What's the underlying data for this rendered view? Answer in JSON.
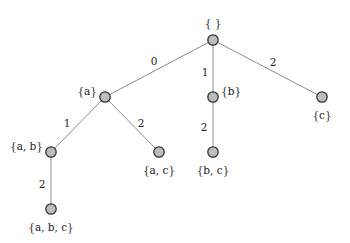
{
  "colors": {
    "node_fill": "#bdbdbd",
    "node_stroke": "#333333",
    "edge": "#8c8c8c",
    "text": "#222222"
  },
  "nodes": [
    {
      "id": "root",
      "label": "{ }",
      "x": 213,
      "y": 40,
      "lx": 213,
      "ly": 24,
      "anchor": "middle"
    },
    {
      "id": "a",
      "label": "{a}",
      "x": 105,
      "y": 97,
      "lx": 97,
      "ly": 92,
      "anchor": "end"
    },
    {
      "id": "b",
      "label": "{b}",
      "x": 213,
      "y": 97,
      "lx": 221,
      "ly": 92,
      "anchor": "start"
    },
    {
      "id": "c",
      "label": "{c}",
      "x": 322,
      "y": 97,
      "lx": 322,
      "ly": 116,
      "anchor": "middle"
    },
    {
      "id": "ab",
      "label": "{a, b}",
      "x": 51,
      "y": 152,
      "lx": 43,
      "ly": 147,
      "anchor": "end"
    },
    {
      "id": "ac",
      "label": "{a, c}",
      "x": 159,
      "y": 152,
      "lx": 159,
      "ly": 171,
      "anchor": "middle"
    },
    {
      "id": "bc",
      "label": "{b, c}",
      "x": 213,
      "y": 152,
      "lx": 213,
      "ly": 171,
      "anchor": "middle"
    },
    {
      "id": "abc",
      "label": "{a, b, c}",
      "x": 51,
      "y": 209,
      "lx": 51,
      "ly": 228,
      "anchor": "middle"
    }
  ],
  "edges": [
    {
      "from": "root",
      "to": "a",
      "label": "0",
      "lx": 154,
      "ly": 62
    },
    {
      "from": "root",
      "to": "b",
      "label": "1",
      "lx": 205,
      "ly": 73
    },
    {
      "from": "root",
      "to": "c",
      "label": "2",
      "lx": 273,
      "ly": 63
    },
    {
      "from": "a",
      "to": "ab",
      "label": "1",
      "lx": 67,
      "ly": 124
    },
    {
      "from": "a",
      "to": "ac",
      "label": "2",
      "lx": 141,
      "ly": 124
    },
    {
      "from": "b",
      "to": "bc",
      "label": "2",
      "lx": 204,
      "ly": 128
    },
    {
      "from": "ab",
      "to": "abc",
      "label": "2",
      "lx": 42,
      "ly": 185
    }
  ]
}
